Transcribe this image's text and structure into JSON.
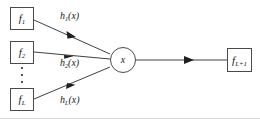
{
  "figure": {
    "width": 260,
    "height": 119,
    "background": "#ffffff",
    "stroke_color": "#4a4a4a",
    "line_color": "#2b2b2b",
    "text_color": "#1a1a1a"
  },
  "inputs": [
    {
      "id": "f1",
      "label_base": "f",
      "label_sub": "1",
      "box": {
        "x": 10,
        "y": 7,
        "w": 24,
        "h": 23
      }
    },
    {
      "id": "f2",
      "label_base": "f",
      "label_sub": "2",
      "box": {
        "x": 10,
        "y": 41,
        "w": 24,
        "h": 23
      }
    },
    {
      "id": "fL",
      "label_base": "f",
      "label_sub": "L",
      "box": {
        "x": 10,
        "y": 88,
        "w": 24,
        "h": 23
      }
    }
  ],
  "ellipsis": {
    "name": "vertical-ellipsis",
    "dot_count": 3,
    "x": 20,
    "y": 67,
    "w": 4,
    "h": 16
  },
  "edges": [
    {
      "id": "e1",
      "from": "f1",
      "to": "node-x",
      "label_base": "h",
      "label_sub": "1",
      "label_arg": "(x)",
      "label_x": 60,
      "label_y": 11
    },
    {
      "id": "e2",
      "from": "f2",
      "to": "node-x",
      "label_base": "h",
      "label_sub": "2",
      "label_arg": "(x)",
      "label_x": 60,
      "label_y": 58
    },
    {
      "id": "eL",
      "from": "fL",
      "to": "node-x",
      "label_base": "h",
      "label_sub": "L",
      "label_arg": "(x)",
      "label_x": 60,
      "label_y": 95
    }
  ],
  "combiner": {
    "id": "node-x",
    "label": "x",
    "shape": "circle",
    "cx": 123,
    "cy": 60,
    "r": 13
  },
  "output": {
    "id": "fL1",
    "label_base": "f",
    "label_sub": "L+1",
    "box": {
      "x": 227,
      "y": 48,
      "w": 25,
      "h": 24
    },
    "edge": {
      "from": "node-x",
      "to": "fL1"
    }
  }
}
